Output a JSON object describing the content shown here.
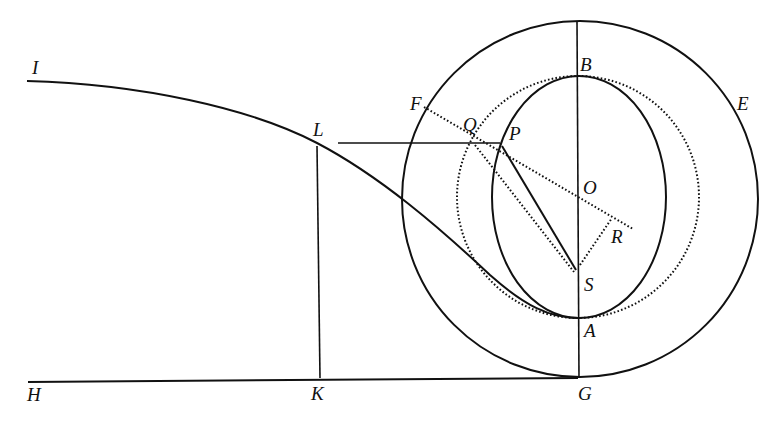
{
  "diagram": {
    "type": "geometric-construction",
    "colors": {
      "ink": "#111111",
      "background": "#ffffff"
    },
    "labels": {
      "I": "I",
      "L": "L",
      "H": "H",
      "K": "K",
      "G": "G",
      "A": "A",
      "S": "S",
      "R": "R",
      "O": "O",
      "B": "B",
      "F": "F",
      "Q": "Q",
      "P": "P",
      "E": "E"
    },
    "points": {
      "I": [
        28,
        82
      ],
      "L": [
        317,
        143
      ],
      "H": [
        28,
        382
      ],
      "K": [
        320,
        382
      ],
      "G": [
        578,
        378
      ],
      "A": [
        578,
        318
      ],
      "S": [
        577,
        272
      ],
      "O": [
        578,
        197
      ],
      "B": [
        578,
        76
      ],
      "R": [
        633,
        229
      ],
      "F": [
        424,
        107
      ],
      "Q": [
        473,
        143
      ],
      "P": [
        500,
        143
      ],
      "E": [
        745,
        120
      ]
    },
    "shapes": [
      {
        "name": "outer-circle",
        "style": "solid",
        "cx": 580,
        "cy": 199,
        "r": 178
      },
      {
        "name": "auxiliary-circle",
        "style": "dotted",
        "cx": 578,
        "cy": 197,
        "r": 121
      },
      {
        "name": "orbit-ellipse",
        "style": "solid",
        "cx": 579,
        "cy": 197,
        "rx": 87,
        "ry": 121
      }
    ],
    "segments": [
      {
        "name": "axis-BG",
        "from": "top",
        "to": "G",
        "style": "solid"
      },
      {
        "name": "line-HG",
        "from": "H",
        "to": "G",
        "style": "solid"
      },
      {
        "name": "line-LK",
        "from": "L",
        "to": "K",
        "style": "solid"
      },
      {
        "name": "line-LP",
        "from": "L",
        "to": "P",
        "style": "solid"
      },
      {
        "name": "line-PS",
        "from": "P",
        "to": "S",
        "style": "solid"
      },
      {
        "name": "line-QS",
        "from": "Q",
        "to": "S",
        "style": "dotted"
      },
      {
        "name": "line-FR",
        "from": "F",
        "to": "R",
        "style": "dotted"
      },
      {
        "name": "line-SR",
        "from": "S",
        "to": "R",
        "style": "dotted"
      },
      {
        "name": "curve-IA",
        "from": "I",
        "to": "A",
        "style": "solid"
      }
    ]
  }
}
